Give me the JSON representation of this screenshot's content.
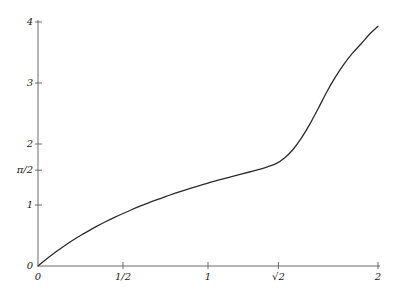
{
  "chart_data": {
    "type": "line",
    "title": "",
    "subtitle": "",
    "xlabel": "",
    "ylabel": "",
    "xlim": [
      0,
      2
    ],
    "ylim": [
      0,
      4
    ],
    "grid": false,
    "legend": null,
    "axis_color": "#6b6b6b",
    "curve_color": "#2b2b2b",
    "background_color": "#ffffff",
    "annotations": [],
    "x_ticks": [
      {
        "value": 0,
        "label": "0"
      },
      {
        "value": 0.5,
        "label": "1/2"
      },
      {
        "value": 1,
        "label": "1"
      },
      {
        "value": 1.41421356,
        "label": "√2"
      },
      {
        "value": 2,
        "label": "2"
      }
    ],
    "y_ticks": [
      {
        "value": 0,
        "label": "0"
      },
      {
        "value": 1,
        "label": "1"
      },
      {
        "value": 1.57079633,
        "label": "π/2"
      },
      {
        "value": 2,
        "label": "2"
      },
      {
        "value": 3,
        "label": "3"
      },
      {
        "value": 4,
        "label": "4"
      }
    ],
    "series": [
      {
        "name": "curve",
        "points": [
          [
            0.0,
            0.0
          ],
          [
            0.05,
            0.115
          ],
          [
            0.1,
            0.222
          ],
          [
            0.15,
            0.321
          ],
          [
            0.2,
            0.414
          ],
          [
            0.25,
            0.5
          ],
          [
            0.3,
            0.581
          ],
          [
            0.35,
            0.657
          ],
          [
            0.4,
            0.729
          ],
          [
            0.45,
            0.797
          ],
          [
            0.5,
            0.861
          ],
          [
            0.55,
            0.922
          ],
          [
            0.6,
            0.98
          ],
          [
            0.65,
            1.035
          ],
          [
            0.7,
            1.088
          ],
          [
            0.75,
            1.138
          ],
          [
            0.8,
            1.186
          ],
          [
            0.85,
            1.232
          ],
          [
            0.9,
            1.276
          ],
          [
            0.95,
            1.318
          ],
          [
            1.0,
            1.359
          ],
          [
            1.05,
            1.398
          ],
          [
            1.1,
            1.436
          ],
          [
            1.15,
            1.473
          ],
          [
            1.2,
            1.509
          ],
          [
            1.25,
            1.545
          ],
          [
            1.3,
            1.583
          ],
          [
            1.35,
            1.625
          ],
          [
            1.4,
            1.677
          ],
          [
            1.41421356,
            1.5708
          ],
          [
            1.45,
            1.77
          ],
          [
            1.5,
            1.91
          ],
          [
            1.55,
            2.1
          ],
          [
            1.6,
            2.33
          ],
          [
            1.65,
            2.59
          ],
          [
            1.7,
            2.86
          ],
          [
            1.75,
            3.1
          ],
          [
            1.8,
            3.31
          ],
          [
            1.85,
            3.49
          ],
          [
            1.9,
            3.64
          ],
          [
            1.95,
            3.8
          ],
          [
            2.0,
            3.93
          ]
        ]
      }
    ]
  },
  "axes": {
    "x_axis_name": "x-axis",
    "y_axis_name": "y-axis"
  }
}
